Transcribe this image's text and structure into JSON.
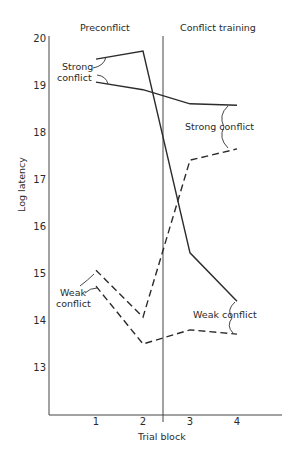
{
  "chart_data": {
    "type": "line",
    "title": "",
    "xlabel": "Trial block",
    "ylabel": "Log latency",
    "x": [
      1,
      2,
      3,
      4
    ],
    "categories": [
      "1",
      "2",
      "3",
      "4"
    ],
    "ylim": [
      12,
      20
    ],
    "yticks": [
      13,
      14,
      15,
      16,
      17,
      18,
      19,
      20
    ],
    "grid": false,
    "phase_labels": [
      "Preconflict",
      "Conflict training"
    ],
    "phase_boundary_after_block": 2.5,
    "series": [
      {
        "name": "Strong conflict (preconflict upper → weak in training)",
        "style": "solid",
        "values": [
          19.55,
          19.72,
          15.43,
          14.4
        ]
      },
      {
        "name": "Strong conflict (preconflict lower → strong in training)",
        "style": "solid",
        "values": [
          19.06,
          18.9,
          18.6,
          18.57
        ]
      },
      {
        "name": "Weak conflict (preconflict upper → strong in training)",
        "style": "dashed",
        "values": [
          15.06,
          14.06,
          17.4,
          17.64
        ]
      },
      {
        "name": "Weak conflict (preconflict lower → weak in training)",
        "style": "dashed",
        "values": [
          14.72,
          13.49,
          13.79,
          13.7
        ]
      }
    ],
    "annotations": [
      {
        "text": [
          "Strong",
          "conflict"
        ],
        "region": "preconflict",
        "refers_to": "solid lines"
      },
      {
        "text": [
          "Weak",
          "conflict"
        ],
        "region": "preconflict",
        "refers_to": "dashed lines"
      },
      {
        "text": [
          "Strong conflict"
        ],
        "region": "conflict training",
        "refers_to": "solid/dashed at ~18.6 and ~17.6"
      },
      {
        "text": [
          "Weak conflict"
        ],
        "region": "conflict training",
        "refers_to": "solid/dashed at ~14.4 and ~13.7"
      }
    ]
  },
  "labels": {
    "phase_left": "Preconflict",
    "phase_right": "Conflict training",
    "xlabel": "Trial block",
    "ylabel": "Log latency",
    "strong_left_1": "Strong",
    "strong_left_2": "conflict",
    "weak_left_1": "Weak",
    "weak_left_2": "conflict",
    "strong_right": "Strong conflict",
    "weak_right": "Weak conflict"
  }
}
